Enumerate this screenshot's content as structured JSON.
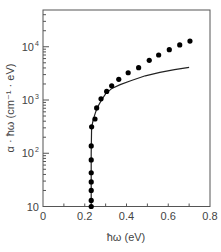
{
  "chart_data": {
    "type": "scatter",
    "title": "",
    "xlabel": "ħω (eV)",
    "ylabel": "α · ħω (cm⁻¹ · eV)",
    "xlim": [
      0,
      0.8
    ],
    "ylim": [
      10,
      49000
    ],
    "yscale": "log",
    "grid": false,
    "legend": null,
    "x_ticks": [
      {
        "value": 0,
        "label": "0"
      },
      {
        "value": 0.2,
        "label": "0.2"
      },
      {
        "value": 0.4,
        "label": "0.4"
      },
      {
        "value": 0.6,
        "label": "0.6"
      },
      {
        "value": 0.8,
        "label": "0.8"
      }
    ],
    "y_ticks": [
      {
        "value": 10,
        "label": "10",
        "sup": ""
      },
      {
        "value": 100,
        "label": "10",
        "sup": "2"
      },
      {
        "value": 1000,
        "label": "10",
        "sup": "3"
      },
      {
        "value": 10000,
        "label": "10",
        "sup": "4"
      }
    ],
    "series": [
      {
        "name": "measured",
        "style": "markers",
        "color": "#000000",
        "x": [
          0.231,
          0.231,
          0.231,
          0.231,
          0.231,
          0.231,
          0.231,
          0.233,
          0.249,
          0.257,
          0.278,
          0.305,
          0.329,
          0.363,
          0.408,
          0.458,
          0.509,
          0.554,
          0.605,
          0.655,
          0.704
        ],
        "y": [
          10,
          13,
          20,
          29,
          43,
          75,
          137,
          313,
          440,
          710,
          1050,
          1450,
          1850,
          2450,
          3250,
          4050,
          5550,
          7000,
          8800,
          10800,
          12800
        ]
      },
      {
        "name": "fit",
        "style": "line",
        "color": "#222222",
        "x": [
          0.231,
          0.231,
          0.233,
          0.24,
          0.25,
          0.26,
          0.28,
          0.3,
          0.33,
          0.37,
          0.42,
          0.49,
          0.56,
          0.63,
          0.7
        ],
        "y": [
          10,
          100,
          300,
          420,
          560,
          720,
          1000,
          1300,
          1650,
          1950,
          2300,
          2850,
          3300,
          3700,
          4100
        ]
      }
    ]
  }
}
